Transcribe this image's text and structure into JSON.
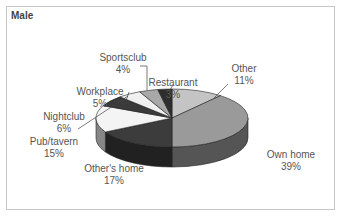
{
  "chart_data": {
    "type": "pie",
    "title": "Male",
    "style": "3d",
    "categories": [
      "Other",
      "Own home",
      "Other's home",
      "Pub/tavern",
      "Nightclub",
      "Workplace",
      "Sportsclub",
      "Restaurant"
    ],
    "values": [
      11,
      39,
      17,
      15,
      6,
      5,
      4,
      3
    ],
    "unit": "%",
    "labels": [
      {
        "name": "Other",
        "value": "11%"
      },
      {
        "name": "Own home",
        "value": "39%"
      },
      {
        "name": "Other's home",
        "value": "17%"
      },
      {
        "name": "Pub/tavern",
        "value": "15%"
      },
      {
        "name": "Nightclub",
        "value": "6%"
      },
      {
        "name": "Workplace",
        "value": "5%"
      },
      {
        "name": "Sportsclub",
        "value": "4%"
      },
      {
        "name": "Restaurant",
        "value": "3%"
      }
    ],
    "colors": [
      "#c4c4c4",
      "#9a9a9a",
      "#3c3c3c",
      "#f4f4f4",
      "#3a3a3a",
      "#f0f0f0",
      "#a8a8a8",
      "#2e2e2e"
    ],
    "legend": "none"
  }
}
